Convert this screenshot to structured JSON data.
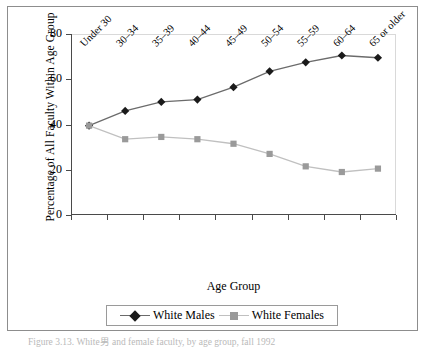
{
  "figure": {
    "caption": "Figure 3.13.   White男 and female faculty, by age group, fall 1992"
  },
  "chart_data": {
    "type": "line",
    "title": "",
    "xlabel": "Age Group",
    "ylabel": "Percentage of All Faculty Within Age Group",
    "categories": [
      "Under 30",
      "30–34",
      "35–39",
      "40–44",
      "45–49",
      "50–54",
      "55–59",
      "60–64",
      "65 or older"
    ],
    "ylim": [
      0,
      80
    ],
    "yticks": [
      0,
      20,
      40,
      60,
      80
    ],
    "grid": false,
    "legend_position": "bottom",
    "series": [
      {
        "name": "White Males",
        "marker": "diamond",
        "color": "#1a1a1a",
        "line_color": "#6b6b6b",
        "values": [
          39.5,
          46.0,
          50.0,
          51.0,
          56.5,
          63.5,
          67.5,
          70.5,
          69.5
        ]
      },
      {
        "name": "White Females",
        "marker": "square",
        "color": "#9a9a9a",
        "line_color": "#c0c0c0",
        "values": [
          39.5,
          33.5,
          34.5,
          33.5,
          31.5,
          27.0,
          21.5,
          19.0,
          20.5
        ]
      }
    ]
  },
  "legend": {
    "items": [
      {
        "label": "White Males"
      },
      {
        "label": "White Females"
      }
    ]
  }
}
